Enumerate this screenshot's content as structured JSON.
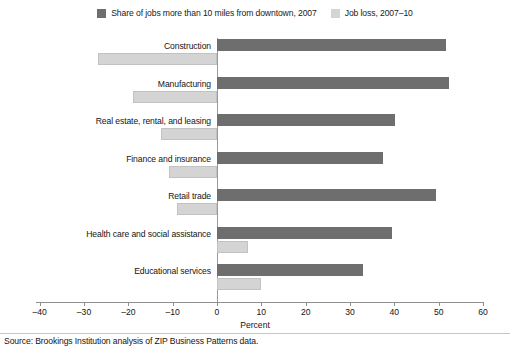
{
  "chart_data": {
    "type": "bar",
    "orientation": "horizontal",
    "title": "",
    "xlabel": "Percent",
    "ylabel": "",
    "xlim": [
      -40,
      60
    ],
    "xticks": [
      -40,
      -30,
      -20,
      -10,
      0,
      10,
      20,
      30,
      40,
      50,
      60
    ],
    "xtick_labels": [
      "–40",
      "–30",
      "–20",
      "–10",
      "0",
      "10",
      "20",
      "30",
      "40",
      "50",
      "60"
    ],
    "grid": false,
    "legend_position": "top-center",
    "categories": [
      "Construction",
      "Manufacturing",
      "Real estate, rental, and leasing",
      "Finance and insurance",
      "Retail trade",
      "Health care and social assistance",
      "Educational services"
    ],
    "series": [
      {
        "name": "Share of jobs more than 10 miles from downtown, 2007",
        "color": "#6e6e6e",
        "values": [
          51.7,
          52.4,
          40.2,
          37.5,
          49.4,
          39.5,
          33.0
        ]
      },
      {
        "name": "Job loss, 2007–10",
        "color": "#d4d4d4",
        "values": [
          -26.9,
          -19.0,
          -12.6,
          -10.8,
          -9.0,
          7.0,
          9.9
        ]
      }
    ],
    "source": "Source: Brookings Institution analysis of ZIP Business Patterns data."
  },
  "legend": {
    "items": [
      {
        "label": "Share of jobs more than 10 miles from downtown, 2007",
        "swatch": "dark"
      },
      {
        "label": "Job loss, 2007–10",
        "swatch": "light"
      }
    ]
  },
  "axis": {
    "xlabel": "Percent"
  },
  "footer": {
    "source": "Source: Brookings Institution analysis of ZIP Business Patterns data."
  }
}
